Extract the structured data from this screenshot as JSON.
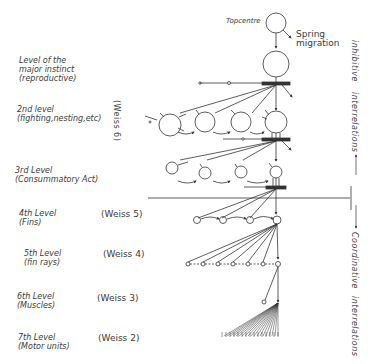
{
  "diagram": {
    "top": {
      "topcentre": "Topcentre",
      "stimulus_line1": "Spring",
      "stimulus_line2": "migration"
    },
    "levels": [
      {
        "line1": "Level of the",
        "line2": "major instinct",
        "line3": "(reproductive)",
        "weiss": ""
      },
      {
        "line1": "2nd level",
        "line2": "(fighting,nesting,etc)",
        "weiss": "(Weiss 6)"
      },
      {
        "line1": "3rd Level",
        "line2": "(Consummatory Act)",
        "weiss": ""
      },
      {
        "line1": "4th Level",
        "line2": "(Fins)",
        "weiss": "(Weiss 5)"
      },
      {
        "line1": "5th Level",
        "line2": "(fin rays)",
        "weiss": "(Weiss 4)"
      },
      {
        "line1": "6th Level",
        "line2": "(Muscles)",
        "weiss": "(Weiss 3)"
      },
      {
        "line1": "7th Level",
        "line2": "(Motor units)",
        "weiss": "(Weiss 2)"
      }
    ],
    "side_labels": {
      "inhibitive": "inhibitive",
      "interrelations_upper": "interrelations",
      "coordinative": "Coordinative",
      "interrelations_lower": "interrelations"
    },
    "colors": {
      "ink": "#333333",
      "background": "#ffffff"
    }
  }
}
